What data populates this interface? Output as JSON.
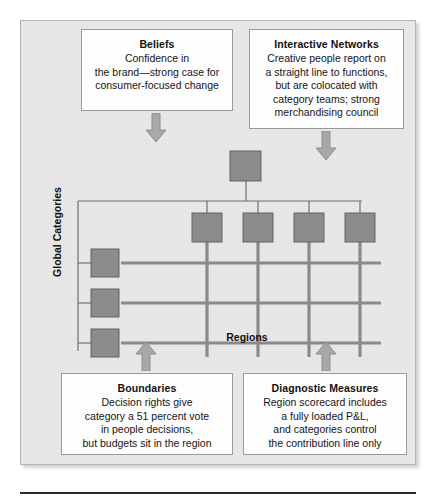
{
  "figure": {
    "background_color": "#e9e9e9",
    "border_color": "#b4b4b4",
    "node_fill": "#8c8c8c",
    "node_stroke": "#636363",
    "grid_color": "#8a8a8a",
    "connector_color": "#6e6e6e",
    "arrow_fill": "#a8a8a8",
    "arrow_stroke": "#8e8e8e"
  },
  "callouts": {
    "beliefs": {
      "title": "Beliefs",
      "lines": [
        "Confidence in",
        "the brand—strong case for",
        "consumer-focused change"
      ]
    },
    "interactive_networks": {
      "title": "Interactive Networks",
      "lines": [
        "Creative people report on",
        "a straight line to functions,",
        "but are colocated with",
        "category teams; strong",
        "merchandising council"
      ]
    },
    "boundaries": {
      "title": "Boundaries",
      "lines": [
        "Decision rights give",
        "category a 51 percent vote",
        "in people decisions,",
        "but budgets sit in the region"
      ]
    },
    "diagnostic_measures": {
      "title": "Diagnostic Measures",
      "lines": [
        "Region scorecard includes",
        "a fully loaded P&L,",
        "and categories control",
        "the contribution line only"
      ]
    }
  },
  "arrows": {
    "beliefs_arrow": "down-arrow",
    "networks_arrow": "down-arrow",
    "boundaries_arrow": "up-arrow",
    "diagnostic_arrow": "up-arrow"
  },
  "matrix": {
    "x_axis_label": "Regions",
    "y_axis_label": "Global Categories",
    "root_node_count": 1,
    "region_node_count": 4,
    "category_node_count": 3,
    "vertical_grid_lines": 4,
    "horizontal_grid_lines": 3
  }
}
